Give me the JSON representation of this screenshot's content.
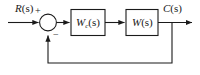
{
  "diagram": {
    "background_color": "#ffffff",
    "line_color": "#1a1a1a",
    "signals": {
      "input_label": "R(s)",
      "input_var": "R",
      "input_arg": "(s)",
      "output_label": "C(s)",
      "output_var": "C",
      "output_arg": "(s)"
    },
    "summing_junction": {
      "name": "summing-junction",
      "shape": "circle",
      "positive_sign": "+",
      "negative_sign": "−",
      "input_port_sign": "+",
      "feedback_port_sign": "−"
    },
    "blocks": [
      {
        "id": "controller",
        "label": "W_c(s)",
        "var": "W",
        "subscript": "c",
        "arg": "(s)"
      },
      {
        "id": "plant",
        "label": "W(s)",
        "var": "W",
        "subscript": "",
        "arg": "(s)"
      }
    ],
    "feedback": {
      "name": "feedback-path",
      "type": "unity",
      "direction": "negative"
    }
  }
}
